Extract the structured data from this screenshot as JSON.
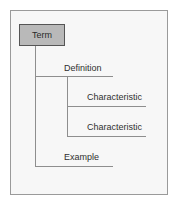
{
  "diagram": {
    "type": "tree",
    "background_color": "#f7f7f7",
    "frame_color": "#9a9a9a",
    "line_color": "#8e8e8e",
    "text_color": "#2f2f2f",
    "root": {
      "label": "Term",
      "shape": "rectangle",
      "fill_color": "#b9b9b9",
      "border_color": "#555555"
    },
    "nodes": [
      {
        "id": "definition",
        "label": "Definition",
        "level": 2,
        "parent": "term"
      },
      {
        "id": "characteristic-1",
        "label": "Characteristic",
        "level": 3,
        "parent": "definition"
      },
      {
        "id": "characteristic-2",
        "label": "Characteristic",
        "level": 3,
        "parent": "definition"
      },
      {
        "id": "example",
        "label": "Example",
        "level": 2,
        "parent": "term"
      }
    ]
  }
}
